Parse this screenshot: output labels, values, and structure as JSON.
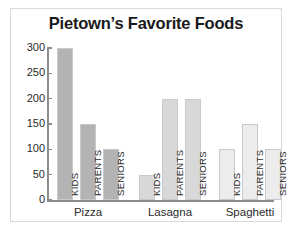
{
  "chart_data": {
    "type": "bar",
    "title": "Pietown’s Favorite Foods",
    "xlabel": "",
    "ylabel": "",
    "ylim": [
      0,
      300
    ],
    "yticks": [
      0,
      50,
      100,
      150,
      200,
      250,
      300
    ],
    "grid": false,
    "legend": "none",
    "categories": [
      "Pizza",
      "Lasagna",
      "Spaghetti"
    ],
    "group_members": [
      "KIDS",
      "PARENTS",
      "SENIORS"
    ],
    "series": [
      {
        "name": "KIDS",
        "values": [
          300,
          50,
          100
        ]
      },
      {
        "name": "PARENTS",
        "values": [
          150,
          200,
          150
        ]
      },
      {
        "name": "SENIORS",
        "values": [
          100,
          200,
          100
        ]
      }
    ],
    "bars": [
      {
        "group": "Pizza",
        "member": "KIDS",
        "value": 300,
        "color": "#b3b3b3"
      },
      {
        "group": "Pizza",
        "member": "PARENTS",
        "value": 150,
        "color": "#b3b3b3"
      },
      {
        "group": "Pizza",
        "member": "SENIORS",
        "value": 100,
        "color": "#b3b3b3"
      },
      {
        "group": "Lasagna",
        "member": "KIDS",
        "value": 50,
        "color": "#d8d8d8"
      },
      {
        "group": "Lasagna",
        "member": "PARENTS",
        "value": 200,
        "color": "#d8d8d8"
      },
      {
        "group": "Lasagna",
        "member": "SENIORS",
        "value": 200,
        "color": "#d8d8d8"
      },
      {
        "group": "Spaghetti",
        "member": "KIDS",
        "value": 100,
        "color": "#ececec"
      },
      {
        "group": "Spaghetti",
        "member": "PARENTS",
        "value": 150,
        "color": "#ececec"
      },
      {
        "group": "Spaghetti",
        "member": "SENIORS",
        "value": 100,
        "color": "#ececec"
      }
    ],
    "colors": {
      "pizza": "#b3b3b3",
      "lasagna": "#d8d8d8",
      "spaghetti": "#ececec",
      "axis": "#8c8c8c",
      "frame": "#d9d9d9",
      "text": "#2b2b2b",
      "background": "#ffffff"
    }
  },
  "ytick_labels": [
    "300",
    "250",
    "200",
    "150",
    "100",
    "50",
    "0"
  ]
}
